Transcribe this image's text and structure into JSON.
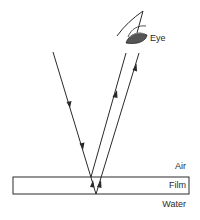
{
  "diagram": {
    "type": "thin-film-interference",
    "labels": {
      "eye": "Eye",
      "air": "Air",
      "film": "Film",
      "water": "Water"
    },
    "colors": {
      "line": "#2a2a2a",
      "eye_fill": "#555555",
      "background": "#ffffff"
    },
    "rays": [
      {
        "name": "incident-ray",
        "direction": "down",
        "arrows": 2
      },
      {
        "name": "reflected-ray-top-surface",
        "direction": "up",
        "arrows": 1
      },
      {
        "name": "reflected-ray-bottom-surface",
        "direction": "up",
        "arrows": 1
      }
    ],
    "layers": [
      "Air",
      "Film",
      "Water"
    ]
  }
}
